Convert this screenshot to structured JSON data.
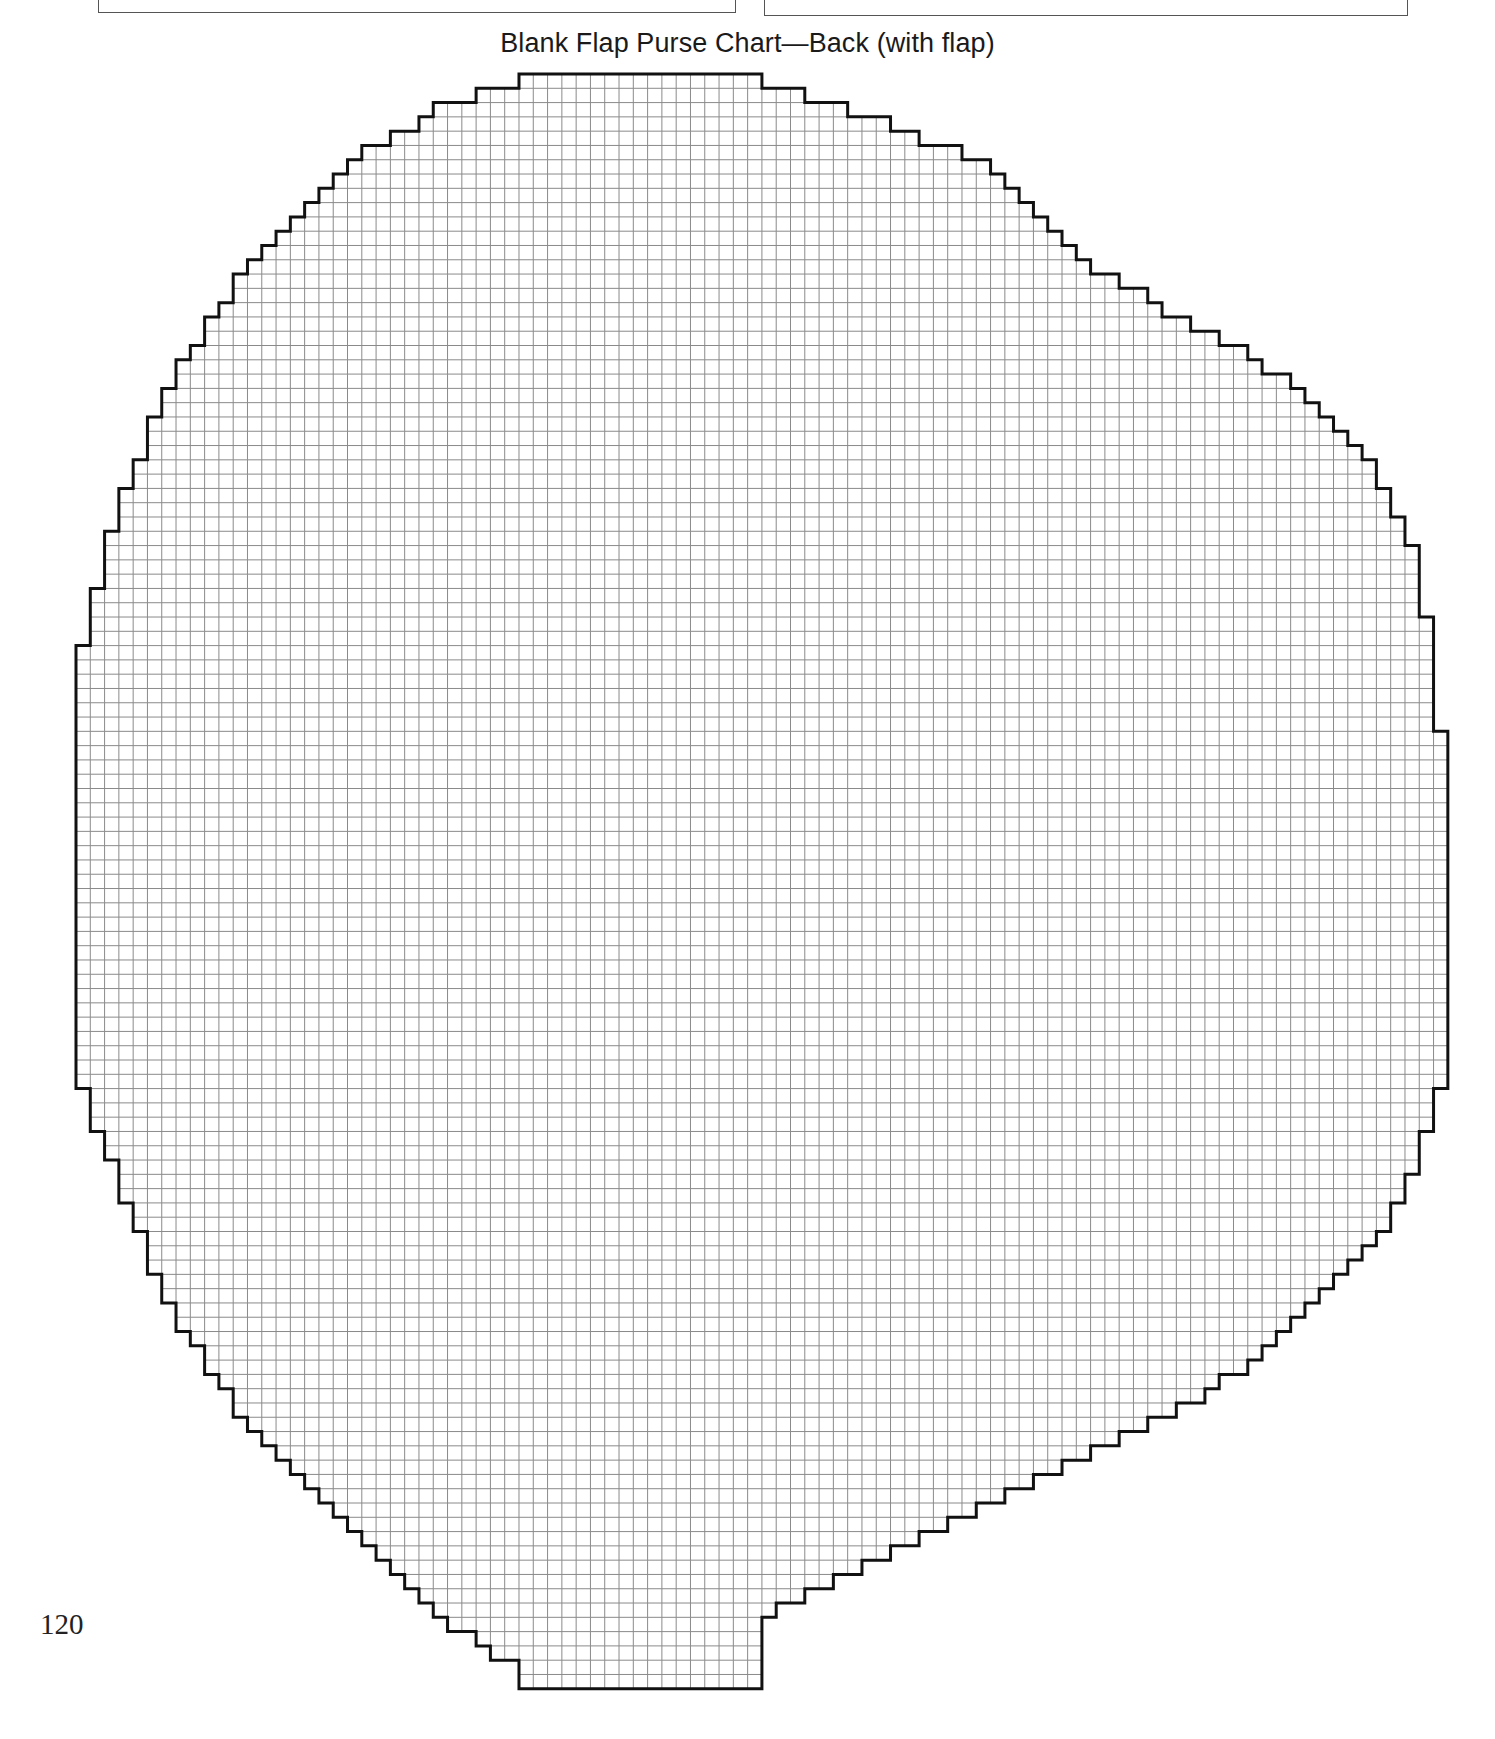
{
  "page": {
    "title": "Blank Flap Purse Chart—Back (with flap)",
    "page_number": "120"
  },
  "grid": {
    "origin_x": 76,
    "origin_y": 74,
    "cell": 14.29,
    "cols": 95,
    "rows": 114,
    "line_color": "#8a8a8a",
    "outline_color": "#111111",
    "left": [
      31,
      28,
      25,
      24,
      22,
      20,
      19,
      18,
      17,
      16,
      15,
      14,
      13,
      12,
      11,
      11,
      10,
      9,
      9,
      8,
      7,
      7,
      6,
      6,
      5,
      5,
      5,
      4,
      4,
      3,
      3,
      3,
      2,
      2,
      2,
      2,
      1,
      1,
      1,
      1,
      0,
      0,
      0,
      0,
      0,
      0,
      0,
      0,
      0,
      0,
      0,
      0,
      0,
      0,
      0,
      0,
      0,
      0,
      0,
      0,
      0,
      0,
      0,
      0,
      0,
      0,
      0,
      0,
      0,
      0,
      0,
      1,
      1,
      1,
      2,
      2,
      3,
      3,
      3,
      4,
      4,
      5,
      5,
      5,
      6,
      6,
      7,
      7,
      8,
      9,
      9,
      10,
      11,
      11,
      12,
      13,
      14,
      15,
      16,
      17,
      18,
      19,
      20,
      21,
      22,
      23,
      24,
      25,
      26,
      28,
      29,
      31,
      31,
      31
    ],
    "right": [
      48,
      51,
      54,
      57,
      59,
      62,
      64,
      65,
      66,
      67,
      68,
      69,
      70,
      71,
      73,
      75,
      76,
      78,
      80,
      82,
      83,
      85,
      86,
      87,
      88,
      89,
      90,
      91,
      91,
      92,
      92,
      93,
      93,
      94,
      94,
      94,
      94,
      94,
      95,
      95,
      95,
      95,
      95,
      95,
      95,
      95,
      96,
      96,
      96,
      96,
      96,
      96,
      96,
      96,
      96,
      96,
      96,
      96,
      96,
      96,
      96,
      96,
      96,
      96,
      96,
      96,
      96,
      96,
      96,
      96,
      96,
      95,
      95,
      95,
      94,
      94,
      94,
      93,
      93,
      92,
      92,
      91,
      90,
      89,
      88,
      87,
      86,
      85,
      84,
      83,
      82,
      80,
      79,
      77,
      75,
      73,
      71,
      69,
      67,
      65,
      63,
      61,
      59,
      57,
      55,
      53,
      51,
      49,
      48,
      48,
      48,
      48,
      48
    ]
  },
  "top_boxes": [
    {
      "name": "left-box"
    },
    {
      "name": "right-box"
    }
  ]
}
